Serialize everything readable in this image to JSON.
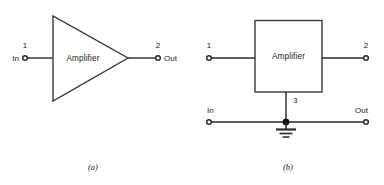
{
  "figure": {
    "background_color": "#ffffff",
    "line_color": "#2b2b2b",
    "panels": [
      {
        "id": "panel-a",
        "caption": "(a)",
        "symbol_shape": "triangle",
        "block_label": "Amplifier",
        "ports": [
          {
            "id": "port-1",
            "number": "1",
            "io_label": "In",
            "side": "left"
          },
          {
            "id": "port-2",
            "number": "2",
            "io_label": "Out",
            "side": "right"
          }
        ]
      },
      {
        "id": "panel-b",
        "caption": "(b)",
        "symbol_shape": "rectangle",
        "block_label": "Amplifier",
        "ports": [
          {
            "id": "port-1",
            "number": "1",
            "io_label": "In",
            "side": "left"
          },
          {
            "id": "port-2",
            "number": "2",
            "io_label": "Out",
            "side": "right"
          },
          {
            "id": "port-3",
            "number": "3",
            "io_label": "",
            "side": "bottom"
          }
        ],
        "ground": {
          "symbol": "earth-ground-icon",
          "bars": 3
        },
        "junction": {
          "symbol": "junction-dot-icon"
        }
      }
    ]
  }
}
